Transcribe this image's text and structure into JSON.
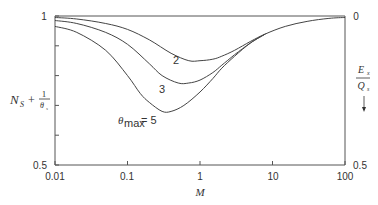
{
  "chart_data": {
    "type": "line",
    "title": "",
    "xlabel": "M",
    "xscale": "log",
    "xlim": [
      0.01,
      100
    ],
    "xticks": [
      0.01,
      0.1,
      1,
      10,
      100
    ],
    "xtick_labels": [
      "0.01",
      "0.1",
      "1",
      "10",
      "100"
    ],
    "ylabel_left": {
      "main": "N",
      "main_sub": "S",
      "plus": "+",
      "frac_num": "1",
      "frac_den": "θ",
      "frac_den_sub": "s"
    },
    "ylim_left": [
      0.5,
      1
    ],
    "yticks_left": [
      0.5,
      0.6,
      0.7,
      0.8,
      0.9,
      1
    ],
    "ytick_labels_left": {
      "top": "1",
      "bottom": "0.5"
    },
    "ylabel_right": {
      "num": "E",
      "num_sub": "x",
      "den": "Q",
      "den_sub": "s",
      "arrow": "↓"
    },
    "ylim_right": [
      0,
      0.5
    ],
    "ytick_labels_right": {
      "top": "0",
      "bottom": "0.5"
    },
    "grid": false,
    "series": [
      {
        "name": "θmax = 2",
        "label": "2",
        "x": [
          0.01,
          0.02,
          0.05,
          0.1,
          0.2,
          0.4,
          0.7,
          1,
          1.5,
          2,
          3,
          5,
          8,
          15,
          30,
          60,
          100
        ],
        "y": [
          0.995,
          0.99,
          0.975,
          0.955,
          0.92,
          0.875,
          0.85,
          0.85,
          0.855,
          0.865,
          0.885,
          0.915,
          0.94,
          0.965,
          0.982,
          0.992,
          0.995
        ]
      },
      {
        "name": "θmax = 3",
        "label": "3",
        "x": [
          0.01,
          0.02,
          0.05,
          0.1,
          0.2,
          0.3,
          0.5,
          0.7,
          1,
          1.5,
          2,
          3,
          5,
          8
        ],
        "y": [
          0.985,
          0.975,
          0.945,
          0.905,
          0.84,
          0.8,
          0.775,
          0.775,
          0.785,
          0.81,
          0.835,
          0.87,
          0.91,
          0.94
        ]
      },
      {
        "name": "θmax = 5",
        "label": "θmax = 5",
        "x": [
          0.01,
          0.02,
          0.05,
          0.1,
          0.15,
          0.2,
          0.3,
          0.4,
          0.6,
          1,
          1.5,
          2,
          3,
          5,
          8
        ],
        "y": [
          0.965,
          0.945,
          0.885,
          0.8,
          0.74,
          0.71,
          0.68,
          0.68,
          0.7,
          0.745,
          0.79,
          0.825,
          0.865,
          0.91,
          0.94
        ]
      }
    ],
    "annotations": [
      {
        "text": "2",
        "series": "θmax = 2"
      },
      {
        "text": "3",
        "series": "θmax = 3"
      },
      {
        "text": "θ",
        "sub": "max",
        "rest": " = 5",
        "series": "θmax = 5"
      }
    ]
  }
}
